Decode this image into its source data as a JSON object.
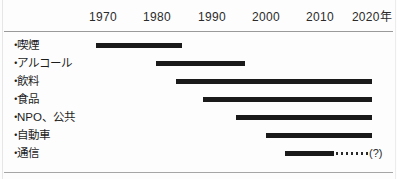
{
  "chart_data": {
    "type": "bar",
    "orientation": "horizontal",
    "subtype": "timeline-gantt",
    "title": "",
    "xlabel": "",
    "ylabel": "",
    "grid": false,
    "legend": null,
    "axis": {
      "unit_suffix": "年",
      "ticks": [
        {
          "label": "1970",
          "value": 1970,
          "x": 103
        },
        {
          "label": "1980",
          "value": 1980,
          "x": 157
        },
        {
          "label": "1990",
          "value": 1990,
          "x": 212
        },
        {
          "label": "2000",
          "value": 2000,
          "x": 266
        },
        {
          "label": "2010",
          "value": 2010,
          "x": 320
        },
        {
          "label": "2020年",
          "value": 2020,
          "x": 372
        }
      ],
      "xlim": [
        1966,
        2024
      ]
    },
    "categories": [
      "喫煙",
      "アルコール",
      "飲料",
      "食品",
      "NPO、公共",
      "自動車",
      "通信"
    ],
    "bars": [
      {
        "category": "喫煙",
        "start_year": 1968,
        "end_year": 1984,
        "x_start": 96,
        "x_end": 182,
        "dotted": false,
        "note": ""
      },
      {
        "category": "アルコール",
        "start_year": 1979,
        "end_year": 1996,
        "x_start": 156,
        "x_end": 245,
        "dotted": false,
        "note": ""
      },
      {
        "category": "飲料",
        "start_year": 1983,
        "end_year": 2020,
        "x_start": 176,
        "x_end": 372,
        "dotted": false,
        "note": ""
      },
      {
        "category": "食品",
        "start_year": 1988,
        "end_year": 2020,
        "x_start": 203,
        "x_end": 372,
        "dotted": false,
        "note": ""
      },
      {
        "category": "NPO、公共",
        "start_year": 1994,
        "end_year": 2020,
        "x_start": 236,
        "x_end": 372,
        "dotted": false,
        "note": ""
      },
      {
        "category": "自動車",
        "start_year": 2000,
        "end_year": 2020,
        "x_start": 266,
        "x_end": 372,
        "dotted": false,
        "note": ""
      },
      {
        "category": "通信",
        "start_year": 2003,
        "end_year": 2012,
        "x_start": 285,
        "x_end": 334,
        "dotted": true,
        "dotted_x_start": 336,
        "dotted_x_end": 368,
        "note": "(?)",
        "note_x": 369
      }
    ],
    "bullet_marker": "・"
  }
}
